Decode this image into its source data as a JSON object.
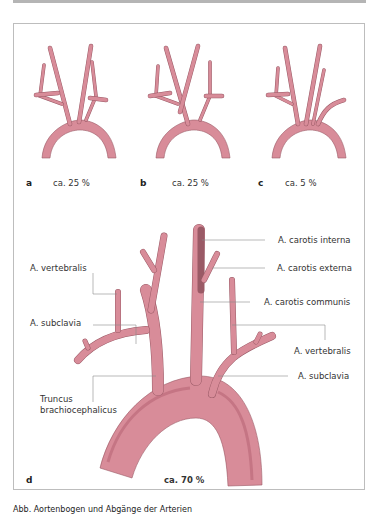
{
  "figure": {
    "panels": [
      {
        "letter": "a",
        "percentage": "ca. 25 %"
      },
      {
        "letter": "b",
        "percentage": "ca. 25 %"
      },
      {
        "letter": "c",
        "percentage": "ca. 5 %"
      },
      {
        "letter": "d",
        "percentage": "ca. 70 %"
      }
    ],
    "labels": {
      "carotis_interna": "A. carotis interna",
      "carotis_externa": "A. carotis externa",
      "carotis_communis": "A. carotis communis",
      "vertebralis_left": "A. vertebralis",
      "vertebralis_right": "A. vertebralis",
      "subclavia_left": "A. subclavia",
      "subclavia_right": "A. subclavia",
      "truncus_line1": "Truncus",
      "truncus_line2": "brachiocephalicus"
    },
    "colors": {
      "vessel_fill": "#d88c99",
      "vessel_stroke": "#9a5a66",
      "vessel_shade": "#c57584",
      "leader_line": "#8a8a8a"
    }
  },
  "caption": "Abb. Aortenbogen und Abgänge der Arterien"
}
